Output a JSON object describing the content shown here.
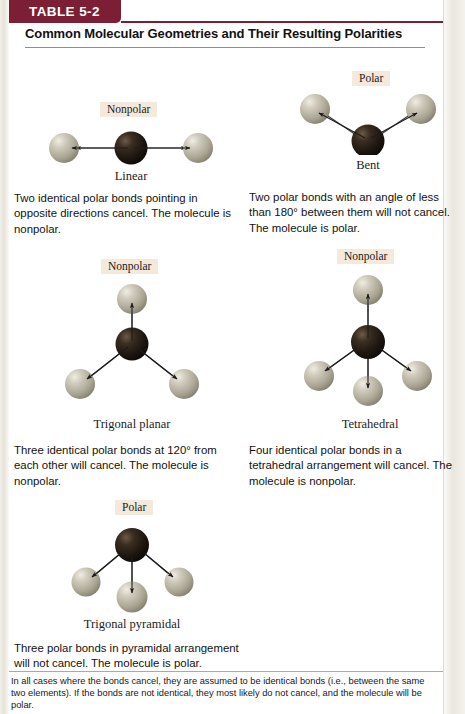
{
  "table": {
    "tab_label": "TABLE 5-2",
    "title": "Common Molecular Geometries and Their Resulting Polarities",
    "footnote": "In all cases where the bonds cancel, they are assumed to be identical bonds (i.e., between the same two elements). If the bonds are not identical, they most likely do not cancel, and the molecule will be polar."
  },
  "colors": {
    "tab_background": "#7c1f34",
    "tab_text": "#ffffff",
    "badge_background": "#f4e9da",
    "central_atom_dark": "#221a13",
    "outer_atom_light": "#b8b3a2",
    "bond_line": "#3a3a3a",
    "rule": "#8e8e8e",
    "page_background": "#ffffff"
  },
  "entries": [
    {
      "id": "linear",
      "badge": "Nonpolar",
      "geometry": "Linear",
      "caption": "Two identical polar bonds pointing in opposite directions cancel. The molecule is nonpolar.",
      "central_atom": "dark",
      "outer_atom_count": 2,
      "bond_angle_deg": 180,
      "dipole_direction": "outward",
      "net_dipole": "zero"
    },
    {
      "id": "bent",
      "badge": "Polar",
      "geometry": "Bent",
      "caption": "Two polar bonds with an angle of less than 180° between them will not cancel. The molecule is polar.",
      "central_atom": "dark",
      "outer_atom_count": 2,
      "bond_angle_deg": 104,
      "dipole_direction": "outward",
      "net_dipole": "nonzero"
    },
    {
      "id": "trigonal-planar",
      "badge": "Nonpolar",
      "geometry": "Trigonal planar",
      "caption": "Three identical polar bonds at 120° from each other will cancel. The molecule is nonpolar.",
      "central_atom": "dark",
      "outer_atom_count": 3,
      "bond_angle_deg": 120,
      "dipole_direction": "outward",
      "net_dipole": "zero"
    },
    {
      "id": "tetrahedral",
      "badge": "Nonpolar",
      "geometry": "Tetrahedral",
      "caption": "Four identical polar bonds in a tetrahedral arrangement will cancel. The molecule is nonpolar.",
      "central_atom": "dark",
      "outer_atom_count": 4,
      "bond_angle_deg": 109.5,
      "dipole_direction": "outward",
      "net_dipole": "zero"
    },
    {
      "id": "trigonal-pyramidal",
      "badge": "Polar",
      "geometry": "Trigonal pyramidal",
      "caption": "Three polar bonds in pyramidal arrangement will not cancel. The molecule is polar.",
      "central_atom": "dark",
      "outer_atom_count": 3,
      "bond_angle_deg": 107,
      "dipole_direction": "outward",
      "net_dipole": "nonzero"
    }
  ]
}
